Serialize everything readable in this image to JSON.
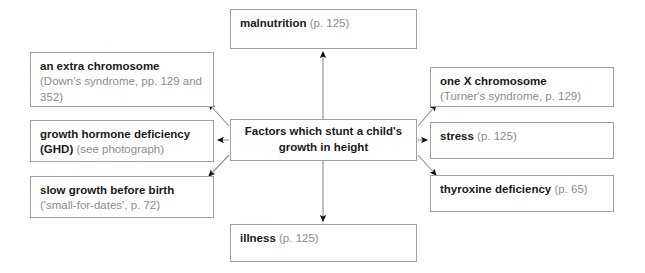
{
  "diagram": {
    "title": "Factors which stunt a child's growth in height",
    "line_color": "#8c8c8c",
    "border_color": "#a0a0a0",
    "term_color": "#1a1a1a",
    "ref_color": "#8c8c8c",
    "center": {
      "line1": "Factors which stunt a child's",
      "line2": "growth in height"
    },
    "nodes": [
      {
        "id": "malnutrition",
        "term": "malnutrition",
        "ref": "(p. 125)",
        "position": "top"
      },
      {
        "id": "extra-chromosome",
        "term": "an extra chromosome",
        "ref": "(Down's syndrome, pp. 129 and 352)",
        "position": "left-upper"
      },
      {
        "id": "ghd",
        "term": "growth hormone deficiency (GHD)",
        "ref": "(see photograph)",
        "position": "left-middle"
      },
      {
        "id": "slow-growth",
        "term": "slow growth before birth",
        "ref": "('small-for-dates', p. 72)",
        "position": "left-lower"
      },
      {
        "id": "one-x",
        "term": "one X chromosome",
        "ref": "(Turner's syndrome, p. 129)",
        "position": "right-upper"
      },
      {
        "id": "stress",
        "term": "stress",
        "ref": "(p. 125)",
        "position": "right-middle"
      },
      {
        "id": "thyroxine",
        "term": "thyroxine deficiency",
        "ref": "(p. 65)",
        "position": "right-lower"
      },
      {
        "id": "illness",
        "term": "illness",
        "ref": "(p. 125)",
        "position": "bottom"
      }
    ]
  }
}
